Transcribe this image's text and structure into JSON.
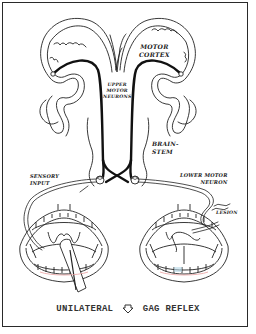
{
  "diagram": {
    "title": "Unilateral gag reflex",
    "labels": {
      "motor_cortex_line1": "MOTOR",
      "motor_cortex_line2": "CORTEX",
      "upper_motor_line1": "UPPER",
      "upper_motor_line2": "MOTOR",
      "upper_motor_line3": "NEURONS",
      "brainstem_line1": "BRAIN-",
      "brainstem_line2": "STEM",
      "sensory_line1": "SENSORY",
      "sensory_line2": "INPUT",
      "lower_motor_line1": "LOWER MOTOR",
      "lower_motor_line2": "NEURON",
      "lesion": "LESION"
    },
    "caption": {
      "left": "UNILATERAL",
      "arrow_icon": "down-arrow-outline-icon",
      "right": "GAG REFLEX"
    },
    "colors": {
      "line": "#222222",
      "neuron": "#111111",
      "frame": "#2a2a2a",
      "gum_tint": "#e8a0a0",
      "tooth_tint": "#b8d8e8"
    },
    "panels": [
      {
        "name": "left-mouth",
        "state": "tongue depressor stimulating pharynx (sensory input side)"
      },
      {
        "name": "right-mouth",
        "state": "uvula deviated, lesion on lower motor neuron"
      }
    ]
  }
}
